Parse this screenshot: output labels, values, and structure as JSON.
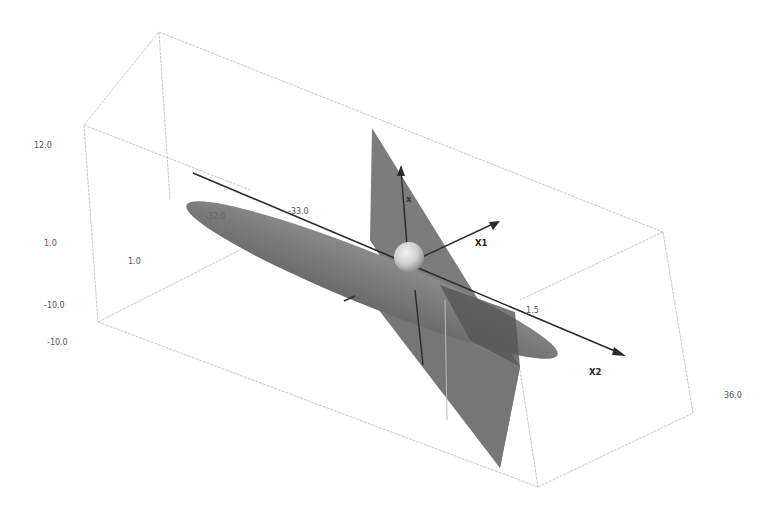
{
  "figure": {
    "axes": [
      {
        "name": "X1",
        "label": "X1"
      },
      {
        "name": "X2",
        "label": "X2"
      },
      {
        "name": "X3",
        "label": "x"
      }
    ],
    "tick_labels": {
      "left_outer": [
        "12.0",
        "1.0",
        "-10.0",
        "-10.0"
      ],
      "left_inner": [
        "1.0"
      ],
      "x2_axis": [
        "-32.0",
        "-33.0",
        "1.5"
      ],
      "right": [
        "36.0"
      ]
    },
    "colors": {
      "background": "#ffffff",
      "box_edge": "#c8c8c8",
      "surface": "#7a7a7a",
      "surface_dark": "#555555",
      "axis": "#2a2a2a",
      "sphere": "#d8d8d8"
    }
  }
}
